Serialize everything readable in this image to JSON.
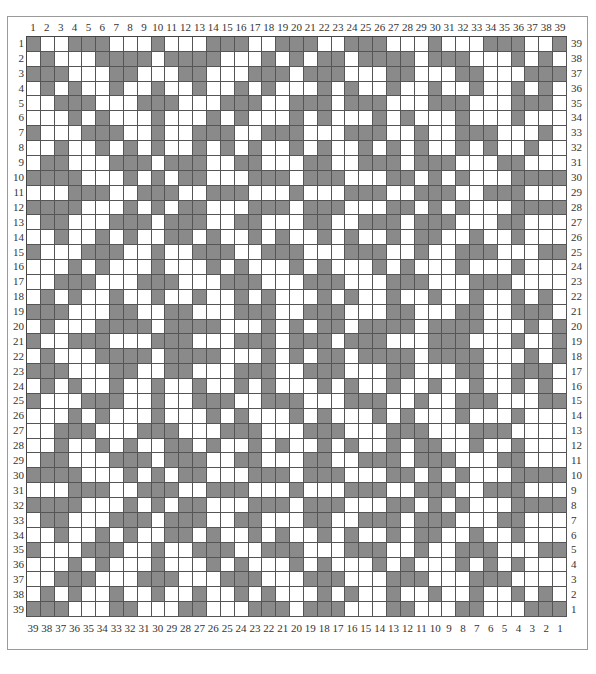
{
  "diagram": {
    "type": "weaving-draft-grid",
    "columns": 39,
    "rows_count": 39,
    "colors": {
      "filled": "#8a8a8a",
      "empty": "#ffffff",
      "grid_line": "#555555",
      "frame": "#9a9a9a"
    },
    "top_labels": [
      "1",
      "2",
      "3",
      "4",
      "5",
      "6",
      "7",
      "8",
      "9",
      "10",
      "11",
      "12",
      "13",
      "14",
      "15",
      "16",
      "17",
      "18",
      "19",
      "20",
      "21",
      "22",
      "23",
      "24",
      "25",
      "26",
      "27",
      "28",
      "29",
      "30",
      "31",
      "32",
      "33",
      "34",
      "35",
      "36",
      "37",
      "38",
      "39"
    ],
    "bottom_labels": [
      "39",
      "38",
      "37",
      "36",
      "35",
      "34",
      "33",
      "32",
      "31",
      "30",
      "29",
      "28",
      "27",
      "26",
      "25",
      "24",
      "23",
      "22",
      "21",
      "20",
      "19",
      "18",
      "17",
      "16",
      "15",
      "14",
      "13",
      "12",
      "11",
      "10",
      "9",
      "8",
      "7",
      "6",
      "5",
      "4",
      "3",
      "2",
      "1"
    ],
    "left_labels": [
      "1",
      "2",
      "3",
      "4",
      "5",
      "6",
      "7",
      "8",
      "9",
      "10",
      "11",
      "12",
      "13",
      "14",
      "15",
      "16",
      "17",
      "18",
      "19",
      "20",
      "21",
      "22",
      "23",
      "24",
      "25",
      "26",
      "27",
      "28",
      "29",
      "30",
      "31",
      "32",
      "33",
      "34",
      "35",
      "36",
      "37",
      "38",
      "39"
    ],
    "right_labels": [
      "39",
      "38",
      "37",
      "36",
      "35",
      "34",
      "33",
      "32",
      "31",
      "30",
      "29",
      "28",
      "27",
      "26",
      "25",
      "24",
      "23",
      "22",
      "21",
      "20",
      "19",
      "18",
      "17",
      "16",
      "15",
      "14",
      "13",
      "12",
      "11",
      "10",
      "9",
      "8",
      "7",
      "6",
      "5",
      "4",
      "3",
      "2",
      "1"
    ],
    "rows": [
      "100111000100011100111001110001000111001",
      "010001111011110001010110111101110001010",
      "111000110001100011101110001100011000111",
      "010100100100100101000101001001001001010",
      "001110001110001110011101110001110001110",
      "000101000100010100010100010100010001000",
      "100011100100111001110001110010011100010",
      "001001010100101010010100101010010100100",
      "011000111011100110001100111011100011000",
      "111100010101100011101110001101010001111",
      "000111001110011100010001110011100111000",
      "111100010101100011101110001101010001111",
      "011000111011100110001100111011100011000",
      "001001010011010010100101001011001001000",
      "100011100100111001110001110010011100011",
      "000101000100010100010100010100010001000",
      "001110001110001110001110001110001110000",
      "010100100100100101000101001001001001010",
      "111000110011000111001110001100011001110",
      "010001111011110001010110111101111000101",
      "100111000111000111011101110001110001001",
      "010001111011110001010110111101111000101",
      "111000110011000111001110001100011001110",
      "010100100100100101000101001001001001010",
      "100011100100111001110001110010011100011",
      "000101000100010100010100010100010001000",
      "001110001110001110001110001110001110000",
      "001001010011010010100101001011001001000",
      "011000111011100110001100111011100011000",
      "111100010101100011101110001101010001111",
      "000111001110011100010001110011100111000",
      "111100010101100011101110001101010001111",
      "011000111011100110001100111011100011000",
      "001001010011010010100101001011001001000",
      "100011100100111001110001110010011100011",
      "000101000100010100010100010100010101000",
      "001110001110001110001110001110001110000",
      "010100100100100101000101001001001001010",
      "111000110001100011101110001100011000111"
    ]
  }
}
